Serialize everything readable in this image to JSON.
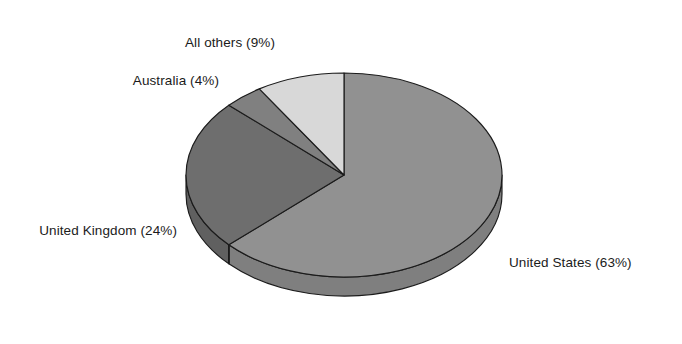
{
  "chart_data": {
    "type": "pie",
    "title": "",
    "subtitle": "",
    "xlabel": "",
    "ylabel": "",
    "legend_position": "none",
    "grid": false,
    "style": "3d-exploded-none",
    "background_color": "#ffffff",
    "outline_color": "#1b1b1b",
    "start_angle_deg": 0,
    "direction": "clockwise",
    "categories": [
      "United States",
      "United Kingdom",
      "Australia",
      "All others"
    ],
    "values": [
      63,
      24,
      4,
      9
    ],
    "units": "percent",
    "total": 100,
    "slices": [
      {
        "name": "United States",
        "value": 63,
        "label": "United States (63%)",
        "percent_text": "63%",
        "color": "#919191",
        "side_color": "#7f7f7f",
        "label_position": "right"
      },
      {
        "name": "United Kingdom",
        "value": 24,
        "label": "United Kingdom (24%)",
        "percent_text": "24%",
        "color": "#6e6e6e",
        "side_color": "#606060",
        "label_position": "left"
      },
      {
        "name": "Australia",
        "value": 4,
        "label": "Australia (4%)",
        "percent_text": "4%",
        "color": "#808080",
        "side_color": "#707070",
        "label_position": "upper-left"
      },
      {
        "name": "All others",
        "value": 9,
        "label": "All others (9%)",
        "percent_text": "9%",
        "color": "#d8d8d8",
        "side_color": "#bdbdbd",
        "label_position": "top"
      }
    ]
  },
  "labels": {
    "all_others": "All others (9%)",
    "australia": "Australia (4%)",
    "united_kingdom": "United Kingdom (24%)",
    "united_states": "United States (63%)"
  },
  "colors": {
    "background": "#ffffff",
    "text": "#1b1b1b",
    "outline": "#1b1b1b",
    "united_states": "#919191",
    "united_kingdom": "#6e6e6e",
    "australia": "#808080",
    "all_others": "#d8d8d8"
  }
}
